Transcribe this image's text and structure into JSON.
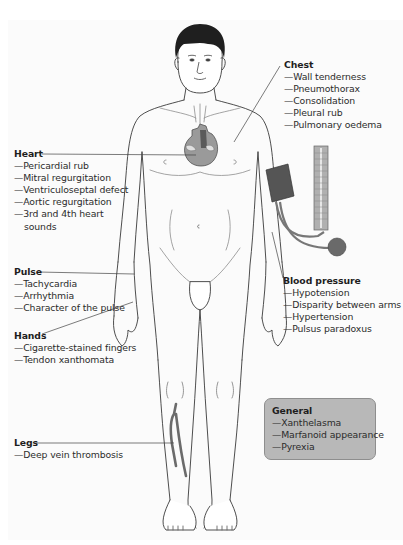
{
  "figure": {
    "colors": {
      "outline": "#3a3a3a",
      "hair": "#1f1f1f",
      "heart_fill": "#9a9a9a",
      "heart_chamber": "#5a5a5a",
      "cuff_fill": "#555555",
      "manometer_fill": "#b0b0b0",
      "bulb_fill": "#6a6a6a",
      "vein_fill": "#6b6b6b",
      "general_box_fill": "#b8b8b8"
    }
  },
  "callouts": {
    "chest": {
      "title": "Chest",
      "items": [
        "—Wall tenderness",
        "—Pneumothorax",
        "—Consolidation",
        "—Pleural rub",
        "—Pulmonary oedema"
      ]
    },
    "heart": {
      "title": "Heart",
      "items": [
        "—Pericardial rub",
        "—Mitral regurgitation",
        "—Ventriculoseptal defect",
        "—Aortic regurgitation",
        "—3rd and 4th heart sounds"
      ]
    },
    "pulse": {
      "title": "Pulse",
      "items": [
        "—Tachycardia",
        "—Arrhythmia",
        "—Character of the pulse"
      ]
    },
    "hands": {
      "title": "Hands",
      "items": [
        "—Cigarette-stained fingers",
        "—Tendon xanthomata"
      ]
    },
    "blood_pressure": {
      "title": "Blood pressure",
      "items": [
        "—Hypotension",
        "—Disparity between arms",
        "—Hypertension",
        "—Pulsus paradoxus"
      ]
    },
    "general": {
      "title": "General",
      "items": [
        "—Xanthelasma",
        "—Marfanoid appearance",
        "—Pyrexia"
      ]
    },
    "legs": {
      "title": "Legs",
      "items": [
        "—Deep vein thrombosis"
      ]
    }
  }
}
